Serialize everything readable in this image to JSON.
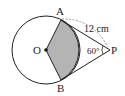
{
  "diagram": {
    "labels": {
      "A": "A",
      "B": "B",
      "O": "O",
      "P": "P",
      "length": "12 cm",
      "angle": "60°"
    },
    "colors": {
      "stroke": "#222222",
      "shade": "#b4b4b4",
      "dashed": "#8a8a8a"
    }
  }
}
